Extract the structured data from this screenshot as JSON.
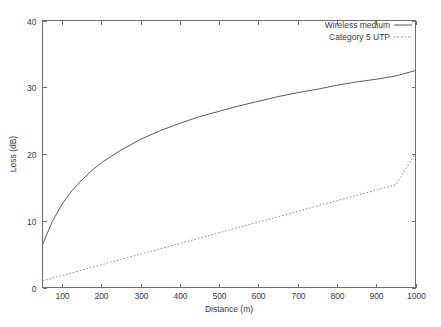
{
  "chart_data": {
    "type": "line",
    "title": "",
    "xlabel": "Distance (m)",
    "ylabel": "Loss (dB)",
    "xlim": [
      50,
      1000
    ],
    "ylim": [
      0,
      40
    ],
    "xticks": [
      100,
      200,
      300,
      400,
      500,
      600,
      700,
      800,
      900,
      1000
    ],
    "yticks": [
      0,
      10,
      20,
      30,
      40
    ],
    "xtick_labels": [
      "100",
      "200",
      "300",
      "400",
      "500",
      "600",
      "700",
      "800",
      "900",
      "1000"
    ],
    "ytick_labels": [
      "0",
      "10",
      "20",
      "30",
      "40"
    ],
    "grid": false,
    "legend_position": "top-right",
    "x": [
      50,
      75,
      100,
      125,
      150,
      175,
      200,
      250,
      300,
      350,
      400,
      450,
      500,
      550,
      600,
      650,
      700,
      750,
      800,
      850,
      900,
      950,
      1000
    ],
    "series": [
      {
        "name": "Wireless medium",
        "style": "solid",
        "color": "#5a5a5a",
        "values": [
          6.4,
          9.9,
          12.5,
          14.5,
          16.1,
          17.5,
          18.7,
          20.6,
          22.2,
          23.5,
          24.6,
          25.6,
          26.4,
          27.2,
          27.9,
          28.6,
          29.2,
          29.7,
          30.3,
          30.8,
          31.2,
          31.7,
          32.5
        ]
      },
      {
        "name": "Category 5 UTP",
        "style": "dotted",
        "color": "#8c8c8c",
        "values": [
          1.0,
          1.4,
          1.8,
          2.2,
          2.6,
          3.0,
          3.4,
          4.2,
          5.0,
          5.8,
          6.6,
          7.4,
          8.2,
          9.0,
          9.8,
          10.6,
          11.4,
          12.2,
          13.0,
          13.8,
          14.6,
          15.4,
          20.1
        ]
      }
    ]
  },
  "legend": {
    "entries": [
      {
        "label": "Wireless medium",
        "style": "solid"
      },
      {
        "label": "Category 5 UTP",
        "style": "dotted"
      }
    ]
  },
  "axes": {
    "x_title": "Distance (m)",
    "y_title": "Loss (dB)"
  }
}
